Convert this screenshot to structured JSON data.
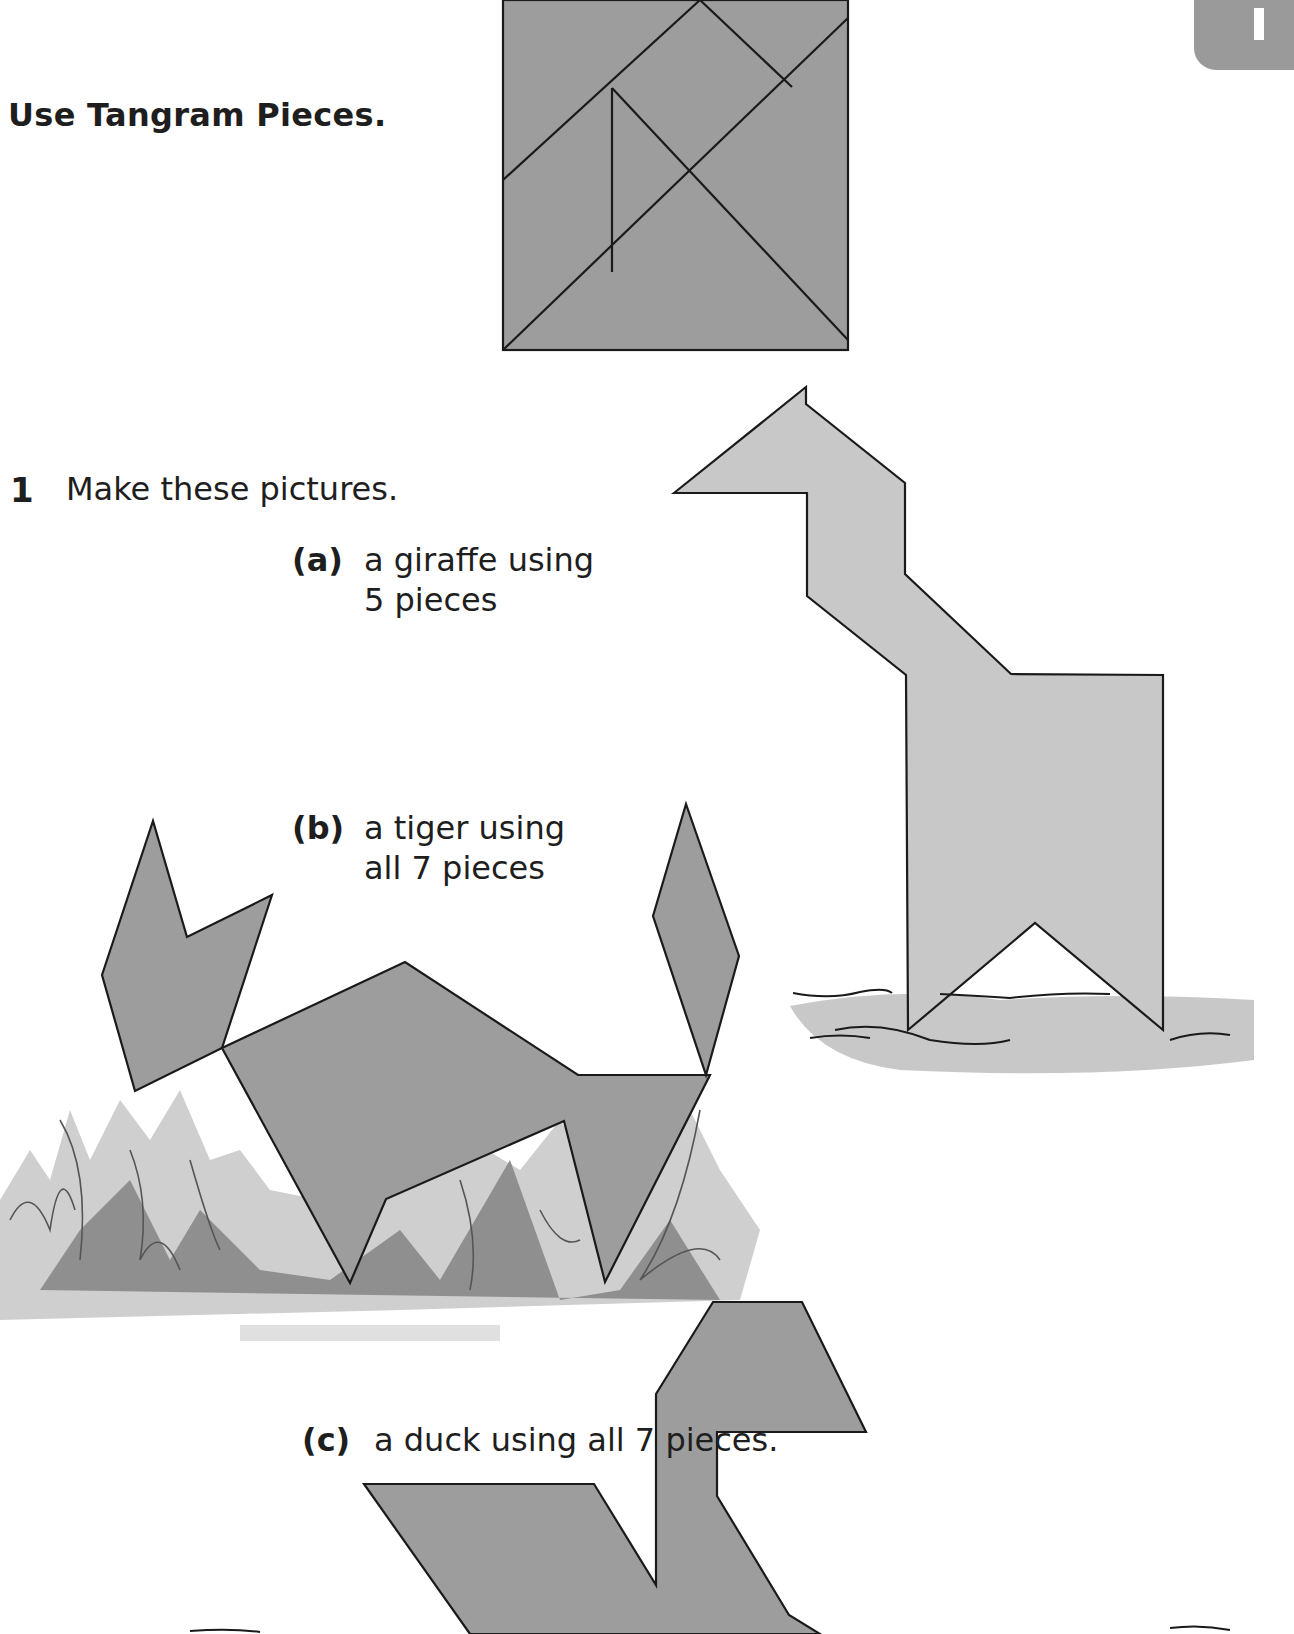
{
  "page": {
    "header": "Use Tangram Pieces.",
    "corner_tab_text": "1"
  },
  "question": {
    "number": "1",
    "prompt": "Make these pictures.",
    "items": [
      {
        "label": "(a)",
        "line1": "a giraffe using",
        "line2": "5 pieces"
      },
      {
        "label": "(b)",
        "line1": "a tiger using",
        "line2": "all 7 pieces"
      },
      {
        "label": "(c)",
        "line1": "a duck using all 7 pieces.",
        "line2": ""
      }
    ]
  },
  "colors": {
    "piece_fill_dark": "#9d9d9d",
    "piece_fill_light": "#c8c8c8",
    "outline": "#1a1a1a",
    "grass_dark": "#8a8a8a",
    "grass_light": "#cfcfcf"
  }
}
